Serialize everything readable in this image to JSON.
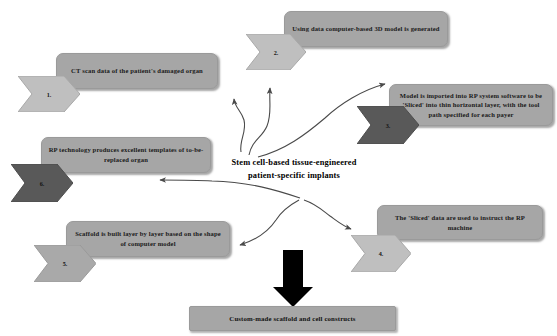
{
  "diagram": {
    "title_center": {
      "line1": "Stem cell-based tissue-engineered",
      "line2": "patient-specific implants"
    },
    "colors": {
      "box_fill": "#a6a6a6",
      "chevron_light": "#bfbfbf",
      "chevron_dark": "#595959",
      "arrow_stroke": "#4a4a4a",
      "black_arrow": "#000000",
      "text": "#111111",
      "background": "#ffffff"
    },
    "steps": [
      {
        "number": "1.",
        "text": "CT scan data of the patient's damaged organ",
        "chevron_style": "light"
      },
      {
        "number": "2.",
        "text": "Using data computer-based 3D model is generated",
        "chevron_style": "light"
      },
      {
        "number": "3.",
        "text": "Model is imported into RP system software to be 'Sliced' into thin horizontal layer, with the tool path specified for each payer",
        "chevron_style": "dark"
      },
      {
        "number": "4.",
        "text": "The 'Sliced' data are used to instruct the RP machine",
        "chevron_style": "light"
      },
      {
        "number": "5.",
        "text": "Scaffold is built layer by layer based on the shape of computer model",
        "chevron_style": "light"
      },
      {
        "number": "6.",
        "text": "RP technology produces excellent templates of to-be-replaced organ",
        "chevron_style": "dark"
      }
    ],
    "output": {
      "text": "Custom-made scaffold and cell constructs"
    }
  }
}
